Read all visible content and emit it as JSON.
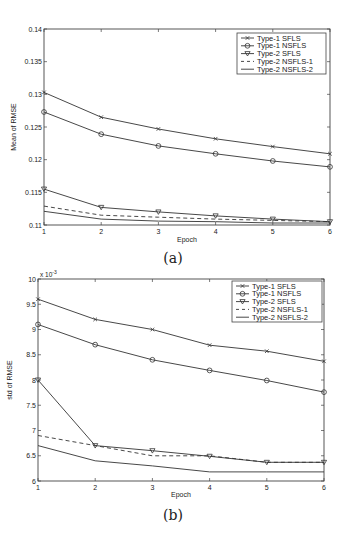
{
  "chart_data": [
    {
      "type": "line",
      "caption": "(a)",
      "title": "",
      "xlabel": "Epoch",
      "ylabel": "Mean of RMSE",
      "x": [
        1,
        2,
        3,
        4,
        5,
        6
      ],
      "xticks": [
        "1",
        "2",
        "3",
        "4",
        "5",
        "6"
      ],
      "ylim": [
        0.11,
        0.14
      ],
      "yticks": [
        "0.11",
        "0.115",
        "0.12",
        "0.125",
        "0.13",
        "0.135",
        "0.14"
      ],
      "ytick_values": [
        0.11,
        0.115,
        0.12,
        0.125,
        0.13,
        0.135,
        0.14
      ],
      "exponent_label": "",
      "grid": false,
      "legend_position": "upper right",
      "series": [
        {
          "name": "Type-1 SFLS",
          "marker": "x",
          "dash": "solid",
          "values": [
            0.1303,
            0.1265,
            0.1247,
            0.1232,
            0.122,
            0.1209
          ]
        },
        {
          "name": "Type-1 NSFLS",
          "marker": "o",
          "dash": "solid",
          "values": [
            0.1273,
            0.1239,
            0.1221,
            0.1209,
            0.1198,
            0.1189
          ]
        },
        {
          "name": "Type-2 SFLS",
          "marker": "v",
          "dash": "solid",
          "values": [
            0.1155,
            0.1127,
            0.112,
            0.1114,
            0.1109,
            0.1105
          ]
        },
        {
          "name": "Type-2 NSFLS-1",
          "marker": "",
          "dash": "dashed",
          "values": [
            0.1129,
            0.1115,
            0.1112,
            0.1109,
            0.1107,
            0.1105
          ]
        },
        {
          "name": "Type-2 NSFLS-2",
          "marker": "",
          "dash": "solid",
          "values": [
            0.1121,
            0.1109,
            0.1106,
            0.1105,
            0.1103,
            0.1103
          ]
        }
      ]
    },
    {
      "type": "line",
      "caption": "(b)",
      "title": "",
      "xlabel": "Epoch",
      "ylabel": "std of RMSE",
      "x": [
        1,
        2,
        3,
        4,
        5,
        6
      ],
      "xticks": [
        "1",
        "2",
        "3",
        "4",
        "5",
        "6"
      ],
      "ylim": [
        6,
        10
      ],
      "yticks": [
        "6",
        "6.5",
        "7",
        "7.5",
        "8",
        "8.5",
        "9",
        "9.5",
        "10"
      ],
      "ytick_values": [
        6,
        6.5,
        7,
        7.5,
        8,
        8.5,
        9,
        9.5,
        10
      ],
      "exponent_label": "x 10",
      "exponent_power": "-3",
      "grid": false,
      "legend_position": "upper right",
      "series": [
        {
          "name": "Type-1 SFLS",
          "marker": "x",
          "dash": "solid",
          "values": [
            9.6,
            9.2,
            9.0,
            8.69,
            8.57,
            8.37
          ]
        },
        {
          "name": "Type-1 NSFLS",
          "marker": "o",
          "dash": "solid",
          "values": [
            9.1,
            8.7,
            8.4,
            8.19,
            7.99,
            7.76
          ]
        },
        {
          "name": "Type-2 SFLS",
          "marker": "v",
          "dash": "solid",
          "values": [
            8.0,
            6.7,
            6.6,
            6.49,
            6.37,
            6.37
          ]
        },
        {
          "name": "Type-2 NSFLS-1",
          "marker": "",
          "dash": "dashed",
          "values": [
            6.9,
            6.7,
            6.5,
            6.5,
            6.37,
            6.37
          ]
        },
        {
          "name": "Type-2 NSFLS-2",
          "marker": "",
          "dash": "solid",
          "values": [
            6.7,
            6.4,
            6.3,
            6.18,
            6.18,
            6.18
          ]
        }
      ]
    }
  ],
  "layout": {
    "line_color": "#333333",
    "axis_color": "#444444"
  }
}
